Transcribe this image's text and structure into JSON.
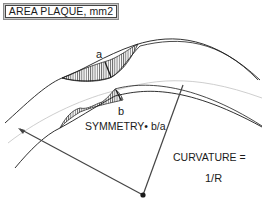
{
  "title": "AREA PLAQUE, mm2",
  "labels": {
    "a": "a",
    "b": "b",
    "symmetry": "SYMMETRY• b/a",
    "curvature": "CURVATURE =",
    "curvature_value": "1/R"
  },
  "colors": {
    "line": "#1a1a1a",
    "centerline": "#c8c8c8",
    "title_bg": "#c8c8c8",
    "radius_line": "#444444"
  }
}
